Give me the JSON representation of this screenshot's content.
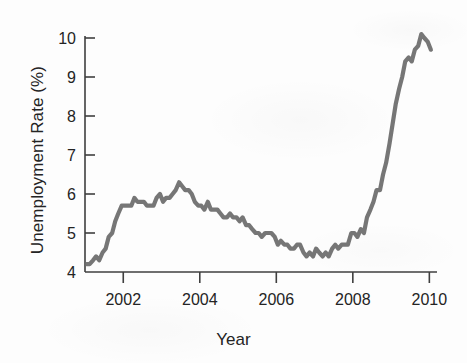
{
  "chart_data": {
    "type": "line",
    "title": "",
    "subtitle": "",
    "xlabel": "Year",
    "ylabel": "Unemployment Rate (%)",
    "xlim": [
      2001.0,
      2010.2
    ],
    "ylim": [
      4,
      10
    ],
    "xticks": [
      2002,
      2004,
      2006,
      2008,
      2010
    ],
    "xtick_labels": [
      "2002",
      "2004",
      "2006",
      "2008",
      "2010"
    ],
    "yticks": [
      4,
      5,
      6,
      7,
      8,
      9,
      10
    ],
    "ytick_labels": [
      "4",
      "5",
      "6",
      "7",
      "8",
      "9",
      "10"
    ],
    "grid": false,
    "legend": null,
    "legend_position": "none",
    "line_color": "#6a6a6a",
    "axis_color": "#3f3f3f",
    "background_color": "#fdfdfd",
    "series": [
      {
        "name": "Unemployment Rate",
        "x": [
          2001.04,
          2001.12,
          2001.21,
          2001.29,
          2001.37,
          2001.46,
          2001.54,
          2001.62,
          2001.71,
          2001.79,
          2001.87,
          2001.96,
          2002.04,
          2002.12,
          2002.21,
          2002.29,
          2002.37,
          2002.46,
          2002.54,
          2002.62,
          2002.71,
          2002.79,
          2002.87,
          2002.96,
          2003.04,
          2003.12,
          2003.21,
          2003.29,
          2003.37,
          2003.46,
          2003.54,
          2003.62,
          2003.71,
          2003.79,
          2003.87,
          2003.96,
          2004.04,
          2004.12,
          2004.21,
          2004.29,
          2004.37,
          2004.46,
          2004.54,
          2004.62,
          2004.71,
          2004.79,
          2004.87,
          2004.96,
          2005.04,
          2005.12,
          2005.21,
          2005.29,
          2005.37,
          2005.46,
          2005.54,
          2005.62,
          2005.71,
          2005.79,
          2005.87,
          2005.96,
          2006.04,
          2006.12,
          2006.21,
          2006.29,
          2006.37,
          2006.46,
          2006.54,
          2006.62,
          2006.71,
          2006.79,
          2006.87,
          2006.96,
          2007.04,
          2007.12,
          2007.21,
          2007.29,
          2007.37,
          2007.46,
          2007.54,
          2007.62,
          2007.71,
          2007.79,
          2007.87,
          2007.96,
          2008.04,
          2008.12,
          2008.21,
          2008.29,
          2008.37,
          2008.46,
          2008.54,
          2008.62,
          2008.71,
          2008.79,
          2008.87,
          2008.96,
          2009.04,
          2009.12,
          2009.21,
          2009.29,
          2009.37,
          2009.46,
          2009.54,
          2009.62,
          2009.71,
          2009.79,
          2009.87,
          2009.96,
          2010.04
        ],
        "y": [
          4.2,
          4.2,
          4.3,
          4.4,
          4.3,
          4.5,
          4.6,
          4.9,
          5.0,
          5.3,
          5.5,
          5.7,
          5.7,
          5.7,
          5.7,
          5.9,
          5.8,
          5.8,
          5.8,
          5.7,
          5.7,
          5.7,
          5.9,
          6.0,
          5.8,
          5.9,
          5.9,
          6.0,
          6.1,
          6.3,
          6.2,
          6.1,
          6.1,
          6.0,
          5.8,
          5.7,
          5.7,
          5.6,
          5.8,
          5.6,
          5.6,
          5.6,
          5.5,
          5.4,
          5.4,
          5.5,
          5.4,
          5.4,
          5.3,
          5.4,
          5.2,
          5.2,
          5.1,
          5.0,
          5.0,
          4.9,
          5.0,
          5.0,
          5.0,
          4.9,
          4.7,
          4.8,
          4.7,
          4.7,
          4.6,
          4.6,
          4.7,
          4.7,
          4.5,
          4.4,
          4.5,
          4.4,
          4.6,
          4.5,
          4.4,
          4.5,
          4.4,
          4.6,
          4.7,
          4.6,
          4.7,
          4.7,
          4.7,
          5.0,
          5.0,
          4.9,
          5.1,
          5.0,
          5.4,
          5.6,
          5.8,
          6.1,
          6.1,
          6.5,
          6.8,
          7.3,
          7.8,
          8.3,
          8.7,
          9.0,
          9.4,
          9.5,
          9.4,
          9.7,
          9.8,
          10.1,
          10.0,
          9.9,
          9.7
        ]
      }
    ]
  }
}
